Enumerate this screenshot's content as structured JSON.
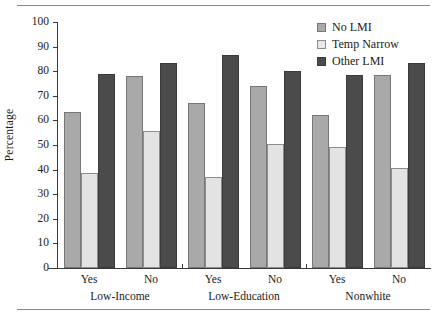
{
  "chart_data": {
    "type": "bar",
    "title": "",
    "xlabel": "",
    "ylabel": "Percentage",
    "ylim": [
      0,
      100
    ],
    "ytick_values": [
      0,
      10,
      20,
      30,
      40,
      50,
      60,
      70,
      80,
      90,
      100
    ],
    "ytick_labels": [
      "0",
      "10",
      "20",
      "30",
      "40",
      "50",
      "60",
      "70",
      "80",
      "90",
      "100"
    ],
    "grid": false,
    "legend_position": "top-right",
    "categories": [
      "Yes",
      "No",
      "Yes",
      "No",
      "Yes",
      "No"
    ],
    "group_labels": [
      "Low-Income",
      "Low-Education",
      "Nonwhite"
    ],
    "series": [
      {
        "name": "No LMI",
        "color": "#a9a9a9",
        "values": [
          63.5,
          78.0,
          67.0,
          74.0,
          62.0,
          78.5
        ]
      },
      {
        "name": "Temp Narrow",
        "color": "#e3e3e3",
        "values": [
          38.5,
          55.5,
          37.0,
          50.3,
          49.0,
          40.5
        ]
      },
      {
        "name": "Other LMI",
        "color": "#4b4b4b",
        "values": [
          79.0,
          83.5,
          86.5,
          80.0,
          78.5,
          83.5
        ]
      }
    ]
  },
  "legend": {
    "items": [
      {
        "label": "No LMI"
      },
      {
        "label": "Temp Narrow"
      },
      {
        "label": "Other LMI"
      }
    ]
  }
}
